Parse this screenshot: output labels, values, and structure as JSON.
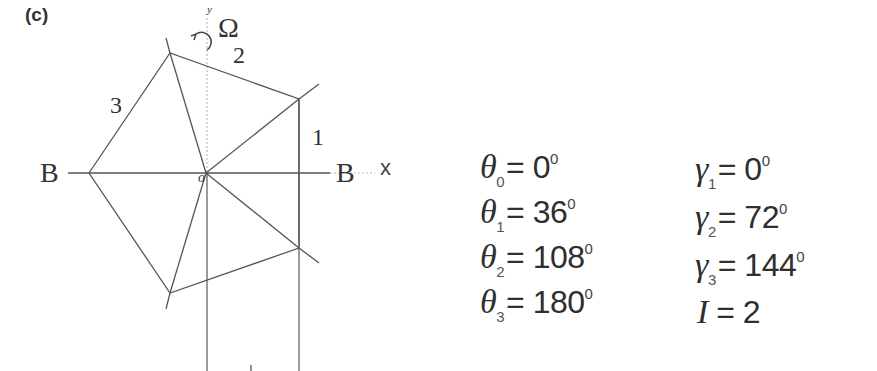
{
  "figure": {
    "panel_label": "(c)",
    "diagram": {
      "axis_labels": {
        "x": "x",
        "y": "y"
      },
      "rotation_symbol": "Ω",
      "boundary_labels": {
        "left": "B",
        "right": "B"
      },
      "origin_label": "o",
      "element_labels": [
        "1",
        "2",
        "3"
      ]
    },
    "equations": {
      "theta": [
        {
          "symbol": "θ",
          "sub": "0",
          "eq": "= 0",
          "sup": "0"
        },
        {
          "symbol": "θ",
          "sub": "1",
          "eq": "= 36",
          "sup": "0"
        },
        {
          "symbol": "θ",
          "sub": "2",
          "eq": "= 108",
          "sup": "0"
        },
        {
          "symbol": "θ",
          "sub": "3",
          "eq": "= 180",
          "sup": "0"
        }
      ],
      "gamma": [
        {
          "symbol": "γ",
          "sub": "1",
          "eq": "= 0",
          "sup": "0"
        },
        {
          "symbol": "γ",
          "sub": "2",
          "eq": "= 72",
          "sup": "0"
        },
        {
          "symbol": "γ",
          "sub": "3",
          "eq": "= 144",
          "sup": "0"
        }
      ],
      "I": {
        "symbol": "I",
        "eq": "= 2"
      }
    }
  }
}
